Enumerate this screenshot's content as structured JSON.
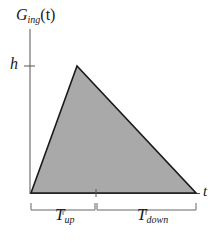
{
  "diagram": {
    "y_axis_label": {
      "main": "G",
      "sub": "ing",
      "arg": "(t)"
    },
    "x_axis_label": "t",
    "height_tick_label": "h",
    "segments": [
      {
        "main": "T",
        "sub": "up"
      },
      {
        "main": "T",
        "sub": "down"
      }
    ],
    "shape": "triangle",
    "colors": {
      "fill": "#a9a9a9",
      "stroke": "#1a1a1a",
      "axis": "#555555"
    }
  }
}
